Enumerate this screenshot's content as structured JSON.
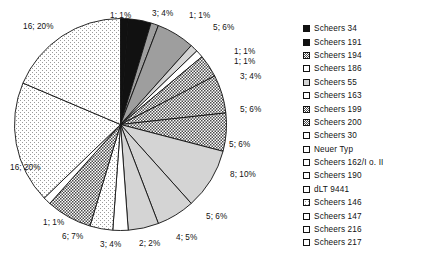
{
  "chart_data": {
    "type": "pie",
    "title": "",
    "xlabel": "",
    "ylabel": "",
    "legend_position": "right",
    "grid": false,
    "total": 81,
    "categories": [
      "Scheers 34",
      "Scheers 191",
      "Scheers 194",
      "Scheers 186",
      "Scheers 55",
      "Scheers 163",
      "Scheers 199",
      "Scheers 200",
      "Scheers 30",
      "Neuer Typ",
      "Scheers 162/I o. II",
      "Scheers 190",
      "dLT 9441",
      "Scheers 146",
      "Scheers 147",
      "Scheers 216",
      "Scheers 217"
    ],
    "values": [
      16,
      16,
      1,
      6,
      3,
      2,
      4,
      5,
      8,
      5,
      5,
      3,
      1,
      1,
      5,
      1,
      3
    ],
    "percents": [
      20,
      20,
      1,
      7,
      4,
      2,
      5,
      6,
      10,
      6,
      6,
      4,
      1,
      1,
      6,
      1,
      4
    ],
    "slice_labels": [
      "1; 1%",
      "3; 4%",
      "1; 1%",
      "5; 6%",
      "1; 1%",
      "1; 1%",
      "3; 4%",
      "5; 6%",
      "5; 6%",
      "8; 10%",
      "5; 6%",
      "4; 5%",
      "2; 2%",
      "3; 4%",
      "6; 7%",
      "1; 1%",
      "16; 20%",
      "16; 20%"
    ]
  },
  "legend": {
    "items": [
      {
        "label": "Scheers 34",
        "fill": "solid-black"
      },
      {
        "label": "Scheers 191",
        "fill": "solid-black"
      },
      {
        "label": "Scheers 194",
        "fill": "dots-dense"
      },
      {
        "label": "Scheers 186",
        "fill": "dots-medium"
      },
      {
        "label": "Scheers 55",
        "fill": "light-gray"
      },
      {
        "label": "Scheers 163",
        "fill": "white"
      },
      {
        "label": "Scheers 199",
        "fill": "dots-dense"
      },
      {
        "label": "Scheers 200",
        "fill": "dots-dense"
      },
      {
        "label": "Scheers 30",
        "fill": "dots-medium"
      },
      {
        "label": "Neuer Typ",
        "fill": "white"
      },
      {
        "label": "Scheers 162/I o. II",
        "fill": "white"
      },
      {
        "label": "Scheers 190",
        "fill": "white"
      },
      {
        "label": "dLT 9441",
        "fill": "dots-medium"
      },
      {
        "label": "Scheers 146",
        "fill": "dots-sparse"
      },
      {
        "label": "Scheers 147",
        "fill": "white"
      },
      {
        "label": "Scheers 216",
        "fill": "white"
      },
      {
        "label": "Scheers 217",
        "fill": "white"
      }
    ]
  },
  "pie": {
    "slices": [
      {
        "label": "1; 1%",
        "value": 1,
        "percent": 1,
        "fill": "solid-black",
        "lx": 110,
        "ly": 11,
        "anchor": "start"
      },
      {
        "label": "3; 4%",
        "value": 3,
        "percent": 4,
        "fill": "solid-black",
        "lx": 152,
        "ly": 9,
        "anchor": "start"
      },
      {
        "label": "1; 1%",
        "value": 1,
        "percent": 1,
        "fill": "mid-gray",
        "lx": 189,
        "ly": 11,
        "anchor": "start"
      },
      {
        "label": "5; 6%",
        "value": 5,
        "percent": 6,
        "fill": "mid-gray",
        "lx": 213,
        "ly": 23,
        "anchor": "start"
      },
      {
        "label": "1; 1%",
        "value": 1,
        "percent": 1,
        "fill": "light-gray",
        "lx": 234,
        "ly": 47,
        "anchor": "start"
      },
      {
        "label": "1; 1%",
        "value": 1,
        "percent": 1,
        "fill": "white",
        "lx": 234,
        "ly": 57,
        "anchor": "start"
      },
      {
        "label": "3; 4%",
        "value": 3,
        "percent": 4,
        "fill": "dots-dense",
        "lx": 240,
        "ly": 72,
        "anchor": "start"
      },
      {
        "label": "5; 6%",
        "value": 5,
        "percent": 6,
        "fill": "dots-dense",
        "lx": 240,
        "ly": 105,
        "anchor": "start"
      },
      {
        "label": "5; 6%",
        "value": 5,
        "percent": 6,
        "fill": "dots-dense",
        "lx": 229,
        "ly": 140,
        "anchor": "start"
      },
      {
        "label": "8; 10%",
        "value": 8,
        "percent": 10,
        "fill": "light-gray",
        "lx": 230,
        "ly": 170,
        "anchor": "start"
      },
      {
        "label": "5; 6%",
        "value": 5,
        "percent": 6,
        "fill": "light-gray",
        "lx": 206,
        "ly": 212,
        "anchor": "start"
      },
      {
        "label": "4; 5%",
        "value": 4,
        "percent": 5,
        "fill": "light-gray",
        "lx": 176,
        "ly": 233,
        "anchor": "start"
      },
      {
        "label": "2; 2%",
        "value": 2,
        "percent": 2,
        "fill": "white",
        "lx": 139,
        "ly": 239,
        "anchor": "start"
      },
      {
        "label": "3; 4%",
        "value": 3,
        "percent": 4,
        "fill": "dots-sparse",
        "lx": 100,
        "ly": 240,
        "anchor": "start"
      },
      {
        "label": "6; 7%",
        "value": 6,
        "percent": 7,
        "fill": "dots-dense",
        "lx": 62,
        "ly": 232,
        "anchor": "start"
      },
      {
        "label": "1; 1%",
        "value": 1,
        "percent": 1,
        "fill": "white",
        "lx": 43,
        "ly": 218,
        "anchor": "start"
      },
      {
        "label": "16; 20%",
        "value": 16,
        "percent": 20,
        "fill": "dots-sparse",
        "lx": 10,
        "ly": 163,
        "anchor": "start"
      },
      {
        "label": "16; 20%",
        "value": 16,
        "percent": 20,
        "fill": "dots-sparse",
        "lx": 23,
        "ly": 22,
        "anchor": "start"
      }
    ]
  }
}
